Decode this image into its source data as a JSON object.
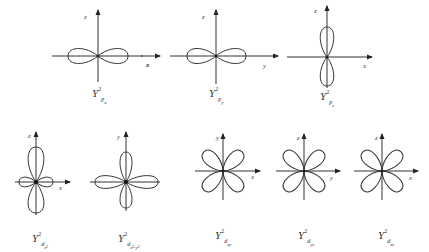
{
  "figure": {
    "panels": [
      {
        "id": "px",
        "caption": {
          "base": "Y",
          "sup": "2",
          "sub": "p",
          "subsub": "x"
        },
        "axes": {
          "vertical": "z",
          "horizontal": "x"
        }
      },
      {
        "id": "py",
        "caption": {
          "base": "Y",
          "sup": "2",
          "sub": "p",
          "subsub": "y"
        },
        "axes": {
          "vertical": "z",
          "horizontal": "y",
          "horizontal_left": "x"
        }
      },
      {
        "id": "pz",
        "caption": {
          "base": "Y",
          "sup": "2",
          "sub": "p",
          "subsub": "z"
        },
        "axes": {
          "vertical": "z",
          "horizontal": "x"
        }
      },
      {
        "id": "dz2",
        "caption": {
          "base": "Y",
          "sup": "2",
          "sub": "d",
          "subsub": "z²"
        },
        "axes": {
          "vertical": "z",
          "horizontal": "x"
        }
      },
      {
        "id": "dx2y2",
        "caption": {
          "base": "Y",
          "sup": "2",
          "sub": "d",
          "subsub": "x²-y²"
        },
        "axes": {
          "vertical": "y",
          "horizontal": ""
        }
      },
      {
        "id": "dxy",
        "caption": {
          "base": "Y",
          "sup": "2",
          "sub": "d",
          "subsub": "xy"
        },
        "axes": {
          "vertical": "y",
          "horizontal": "x"
        }
      },
      {
        "id": "dyz",
        "caption": {
          "base": "Y",
          "sup": "2",
          "sub": "d",
          "subsub": "yz"
        },
        "axes": {
          "vertical": "z",
          "horizontal": "y"
        }
      },
      {
        "id": "dxz",
        "caption": {
          "base": "Y",
          "sup": "2",
          "sub": "d",
          "subsub": "xz"
        },
        "axes": {
          "vertical": "z",
          "horizontal": "x"
        }
      }
    ]
  }
}
